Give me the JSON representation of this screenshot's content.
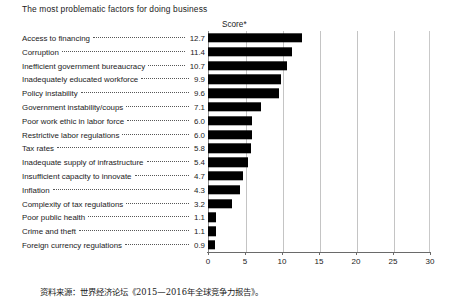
{
  "chart_data": {
    "type": "bar",
    "orientation": "horizontal",
    "title": "The most problematic factors for doing business",
    "xlabel": "Score*",
    "ylabel": "",
    "xlim": [
      0,
      30
    ],
    "xticks": [
      "0",
      "5",
      "10",
      "15",
      "20",
      "25",
      "30"
    ],
    "grid": true,
    "legend": null,
    "bar_color": "#000000",
    "categories": [
      "Access to financing",
      "Corruption",
      "Inefficient government bureaucracy",
      "Inadequately educated workforce",
      "Policy instability",
      "Government instability/coups",
      "Poor work ethic in labor force",
      "Restrictive labor regulations",
      "Tax rates",
      "Inadequate supply of infrastructure",
      "Insufficient capacity to innovate",
      "Inflation",
      "Complexity of tax regulations",
      "Poor public health",
      "Crime and theft",
      "Foreign currency regulations"
    ],
    "values": [
      12.7,
      11.4,
      10.7,
      9.9,
      9.6,
      7.1,
      6.0,
      6.0,
      5.8,
      5.4,
      4.7,
      4.3,
      3.2,
      1.1,
      1.1,
      0.9
    ],
    "value_labels": [
      "12.7",
      "11.4",
      "10.7",
      "9.9",
      "9.6",
      "7.1",
      "6.0",
      "6.0",
      "5.8",
      "5.4",
      "4.7",
      "4.3",
      "3.2",
      "1.1",
      "1.1",
      "0.9"
    ]
  },
  "footer": {
    "source": "资料来源：世界经济论坛《2015—2016年全球竞争力报告》。"
  }
}
